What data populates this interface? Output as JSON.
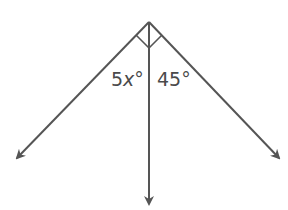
{
  "diagram": {
    "type": "angle-diagram",
    "colors": {
      "stroke": "#555555",
      "text": "#4a4a4a",
      "background": "#ffffff"
    },
    "vertex": {
      "x": 149,
      "y": 22
    },
    "rays": [
      {
        "name": "left-ray",
        "tip": {
          "x": 15,
          "y": 160
        }
      },
      {
        "name": "middle-ray",
        "tip": {
          "x": 149,
          "y": 207
        }
      },
      {
        "name": "right-ray",
        "tip": {
          "x": 281,
          "y": 160
        }
      }
    ],
    "right_angle_mark": true,
    "labels": {
      "left_angle": {
        "coef": "5",
        "var": "x",
        "unit": "°"
      },
      "right_angle": {
        "value": "45",
        "unit": "°"
      }
    }
  }
}
